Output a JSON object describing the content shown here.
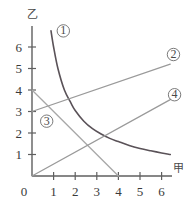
{
  "chart_data": {
    "type": "line",
    "title": "",
    "subtitle": "",
    "xlabel": "甲",
    "ylabel": "乙",
    "xlim": [
      0,
      6.8
    ],
    "ylim": [
      0,
      7.0
    ],
    "xticks": [
      "0",
      "1",
      "2",
      "3",
      "4",
      "5",
      "6"
    ],
    "yticks": [
      "1",
      "2",
      "3",
      "4",
      "5",
      "6"
    ],
    "xtick_values": [
      0,
      1,
      2,
      3,
      4,
      5,
      6
    ],
    "ytick_values": [
      1,
      2,
      3,
      4,
      5,
      6
    ],
    "grid": false,
    "legend": "inline-curve-labels",
    "origin_label": "0",
    "series": [
      {
        "name": "①",
        "label": "①",
        "kind": "curve",
        "shape": "hyperbola",
        "color": "#5a5258",
        "label_x": 1.45,
        "label_y": 6.75,
        "x": [
          0.88,
          1.0,
          1.2,
          1.5,
          1.8,
          2.0,
          2.4,
          2.8,
          3.2,
          3.6,
          4.0,
          4.5,
          5.0,
          5.5,
          6.0,
          6.4
        ],
        "y": [
          6.75,
          6.0,
          5.0,
          4.0,
          3.4,
          3.05,
          2.55,
          2.2,
          1.95,
          1.75,
          1.6,
          1.42,
          1.28,
          1.17,
          1.07,
          1.0
        ]
      },
      {
        "name": "②",
        "label": "②",
        "kind": "line",
        "color": "#9a9a9a",
        "label_x": 6.55,
        "label_y": 5.65,
        "x": [
          0,
          6.4
        ],
        "y": [
          3.0,
          5.2
        ]
      },
      {
        "name": "③",
        "label": "③",
        "kind": "line",
        "color": "#a8a8a8",
        "label_x": 0.68,
        "label_y": 2.55,
        "x": [
          0,
          4.0
        ],
        "y": [
          4.0,
          0
        ]
      },
      {
        "name": "④",
        "label": "④",
        "kind": "line",
        "color": "#9a9a9a",
        "label_x": 6.6,
        "label_y": 3.78,
        "x": [
          0,
          6.4
        ],
        "y": [
          0,
          3.55
        ]
      }
    ],
    "colors": {
      "axis": "#5f5f5f",
      "curve_1": "#5a5258",
      "line_2": "#9a9a9a",
      "line_3": "#a8a8a8",
      "line_4": "#9a9a9a",
      "text": "#3a3a3a",
      "background": "#ffffff"
    }
  }
}
